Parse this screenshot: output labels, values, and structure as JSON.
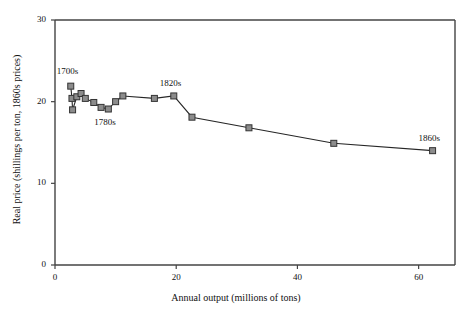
{
  "chart_data": {
    "type": "line",
    "title": "",
    "xlabel": "Annual output (millions of tons)",
    "ylabel": "Real price (shillings per ton, 1860s prices)",
    "xlim": [
      0,
      66
    ],
    "ylim": [
      0,
      30
    ],
    "xticks": [
      0,
      20,
      40,
      60
    ],
    "xtick_labels": [
      "0",
      "20",
      "40",
      "60"
    ],
    "yticks": [
      0,
      10,
      20,
      30
    ],
    "ytick_labels": [
      "0",
      "10",
      "20",
      "30"
    ],
    "grid": false,
    "legend": null,
    "marker": "square",
    "marker_face_color": "#8c8c8c",
    "marker_edge_color": "#333333",
    "line_color": "#262626",
    "series": [
      {
        "name": "Real coal price vs annual output",
        "points": [
          {
            "x": 2.6,
            "y": 21.9
          },
          {
            "x": 2.8,
            "y": 20.4
          },
          {
            "x": 2.9,
            "y": 19.0
          },
          {
            "x": 3.6,
            "y": 20.6
          },
          {
            "x": 4.3,
            "y": 21.0
          },
          {
            "x": 5.0,
            "y": 20.4
          },
          {
            "x": 6.4,
            "y": 19.9
          },
          {
            "x": 7.6,
            "y": 19.3
          },
          {
            "x": 8.8,
            "y": 19.1
          },
          {
            "x": 10.0,
            "y": 20.0
          },
          {
            "x": 11.2,
            "y": 20.7
          },
          {
            "x": 16.4,
            "y": 20.4
          },
          {
            "x": 19.6,
            "y": 20.7
          },
          {
            "x": 22.6,
            "y": 18.1
          },
          {
            "x": 32.0,
            "y": 16.8
          },
          {
            "x": 46.0,
            "y": 14.9
          },
          {
            "x": 62.3,
            "y": 14.0
          }
        ]
      }
    ],
    "annotations": [
      {
        "text": "1700s",
        "x": 2.6,
        "y": 21.9,
        "position": "above-left"
      },
      {
        "text": "1780s",
        "x": 8.8,
        "y": 19.1,
        "position": "below"
      },
      {
        "text": "1820s",
        "x": 19.6,
        "y": 20.7,
        "position": "above"
      },
      {
        "text": "1860s",
        "x": 62.3,
        "y": 14.0,
        "position": "above"
      }
    ]
  }
}
